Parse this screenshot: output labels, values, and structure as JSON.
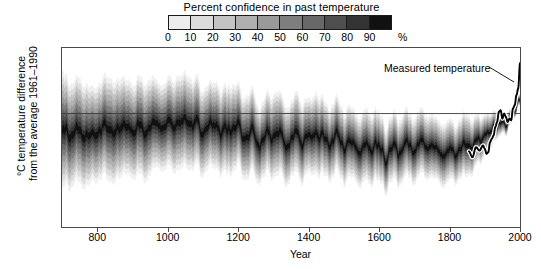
{
  "legend": {
    "title": "Percent confidence in past temperature",
    "ticks": [
      "0",
      "10",
      "20",
      "30",
      "40",
      "50",
      "60",
      "70",
      "80",
      "90"
    ],
    "unit": "%",
    "swatches": [
      "#ededed",
      "#dcdcdc",
      "#c4c4c4",
      "#b0b0b0",
      "#9a9a9a",
      "#7e7e7e",
      "#686868",
      "#4e4e4e",
      "#333333",
      "#111111"
    ]
  },
  "axes": {
    "ylabel_line1": "°C temperature difference",
    "ylabel_line2": "from the average 1961–1990",
    "xlabel": "Year",
    "yticks": [
      "0.5",
      "0",
      "−0.5",
      "−1.0"
    ],
    "ytick_values": [
      0.5,
      0,
      -0.5,
      -1.0
    ],
    "xticks": [
      "800",
      "1000",
      "1200",
      "1400",
      "1600",
      "1800",
      "2000"
    ],
    "xtick_values": [
      800,
      1000,
      1200,
      1400,
      1600,
      1800,
      2000
    ]
  },
  "annotation": {
    "measured_label": "Measured temperature"
  },
  "chart_data": {
    "type": "area",
    "title": "Percent confidence in past temperature",
    "xlabel": "Year",
    "ylabel": "°C temperature difference from the average 1961–1990",
    "xlim": [
      700,
      2000
    ],
    "ylim": [
      -1.35,
      0.78
    ],
    "grid": false,
    "legend_position": "top",
    "zero_line": 0,
    "confidence_levels": [
      0,
      10,
      20,
      30,
      40,
      50,
      60,
      70,
      80,
      90
    ],
    "series": [
      {
        "name": "Reconstruction median",
        "x": [
          700,
          720,
          740,
          760,
          780,
          800,
          820,
          840,
          860,
          880,
          900,
          920,
          940,
          960,
          980,
          1000,
          1020,
          1040,
          1060,
          1080,
          1100,
          1120,
          1140,
          1160,
          1180,
          1200,
          1220,
          1240,
          1260,
          1280,
          1300,
          1320,
          1340,
          1360,
          1380,
          1400,
          1420,
          1440,
          1460,
          1480,
          1500,
          1520,
          1540,
          1560,
          1580,
          1600,
          1620,
          1640,
          1660,
          1680,
          1700,
          1720,
          1740,
          1760,
          1780,
          1800,
          1820,
          1840,
          1860,
          1880,
          1900,
          1920,
          1940,
          1960,
          1980,
          2000
        ],
        "values": [
          -0.22,
          -0.28,
          -0.18,
          -0.3,
          -0.2,
          -0.26,
          -0.16,
          -0.3,
          -0.22,
          -0.12,
          -0.24,
          -0.1,
          -0.2,
          -0.08,
          -0.18,
          -0.05,
          -0.14,
          -0.06,
          -0.16,
          -0.08,
          -0.18,
          -0.1,
          -0.22,
          -0.14,
          -0.26,
          -0.16,
          -0.3,
          -0.2,
          -0.34,
          -0.24,
          -0.3,
          -0.22,
          -0.36,
          -0.26,
          -0.38,
          -0.28,
          -0.34,
          -0.24,
          -0.36,
          -0.28,
          -0.4,
          -0.3,
          -0.42,
          -0.32,
          -0.44,
          -0.36,
          -0.48,
          -0.38,
          -0.46,
          -0.36,
          -0.44,
          -0.34,
          -0.42,
          -0.34,
          -0.46,
          -0.38,
          -0.44,
          -0.4,
          -0.42,
          -0.34,
          -0.28,
          -0.18,
          -0.1,
          -0.12,
          -0.02,
          0.2
        ]
      },
      {
        "name": "Measured temperature",
        "x": [
          1855,
          1865,
          1875,
          1885,
          1895,
          1900,
          1905,
          1910,
          1915,
          1920,
          1925,
          1930,
          1935,
          1940,
          1945,
          1950,
          1955,
          1960,
          1965,
          1970,
          1975,
          1980,
          1985,
          1990,
          1995,
          2000
        ],
        "values": [
          -0.45,
          -0.52,
          -0.4,
          -0.44,
          -0.38,
          -0.42,
          -0.48,
          -0.46,
          -0.34,
          -0.3,
          -0.26,
          -0.16,
          -0.1,
          0.02,
          0.04,
          -0.06,
          0.0,
          -0.04,
          -0.1,
          -0.06,
          -0.08,
          0.06,
          0.1,
          0.22,
          0.3,
          0.6
        ],
        "color": "#000000",
        "halo": "#ffffff"
      }
    ]
  }
}
